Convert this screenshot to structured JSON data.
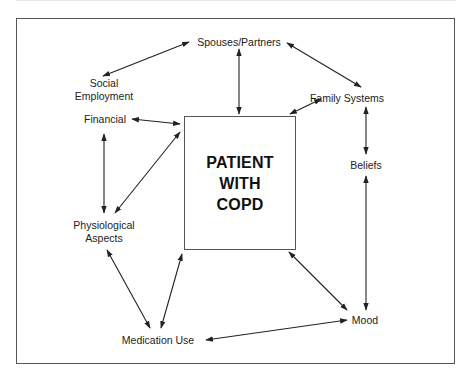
{
  "diagram": {
    "center": {
      "lines": [
        "PATIENT",
        "WITH",
        "COPD"
      ]
    },
    "nodes": {
      "spouses_partners": "Spouses/Partners",
      "social_employment": [
        "Social",
        "Employment"
      ],
      "financial": "Financial",
      "family_systems": "Family Systems",
      "beliefs": "Beliefs",
      "physiological_aspects": [
        "Physiological",
        "Aspects"
      ],
      "medication_use": "Medication Use",
      "mood": "Mood"
    },
    "edges": [
      {
        "from": "Spouses/Partners",
        "to": "Social Employment",
        "type": "bidirectional"
      },
      {
        "from": "Spouses/Partners",
        "to": "Family Systems",
        "type": "bidirectional"
      },
      {
        "from": "Spouses/Partners",
        "to": "PATIENT WITH COPD",
        "type": "bidirectional"
      },
      {
        "from": "Financial",
        "to": "PATIENT WITH COPD",
        "type": "bidirectional"
      },
      {
        "from": "Family Systems",
        "to": "PATIENT WITH COPD",
        "type": "bidirectional"
      },
      {
        "from": "Family Systems",
        "to": "Beliefs",
        "type": "bidirectional"
      },
      {
        "from": "Beliefs",
        "to": "Mood",
        "type": "bidirectional"
      },
      {
        "from": "Financial",
        "to": "Physiological Aspects",
        "type": "bidirectional"
      },
      {
        "from": "Physiological Aspects",
        "to": "PATIENT WITH COPD",
        "type": "bidirectional"
      },
      {
        "from": "Physiological Aspects",
        "to": "Medication Use",
        "type": "bidirectional"
      },
      {
        "from": "Medication Use",
        "to": "PATIENT WITH COPD",
        "type": "bidirectional"
      },
      {
        "from": "PATIENT WITH COPD",
        "to": "Mood",
        "type": "bidirectional"
      },
      {
        "from": "Medication Use",
        "to": "Mood",
        "type": "bidirectional"
      }
    ],
    "colors": {
      "line": "#222222",
      "frame": "#555555",
      "background": "#ffffff"
    }
  }
}
